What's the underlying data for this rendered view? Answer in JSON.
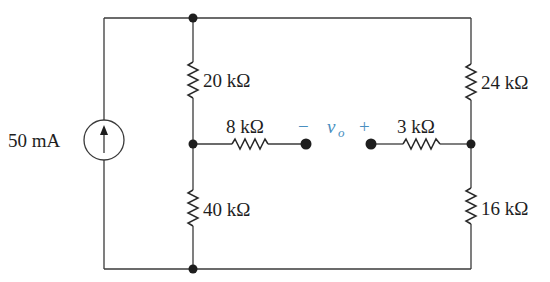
{
  "diagram": {
    "type": "circuit",
    "source": {
      "label": "50 mA",
      "kind": "current-source",
      "direction": "up"
    },
    "resistors": {
      "r20": "20 kΩ",
      "r40": "40 kΩ",
      "r8": "8 kΩ",
      "r3": "3 kΩ",
      "r24": "24 kΩ",
      "r16": "16 kΩ"
    },
    "output": {
      "minus": "−",
      "plus": "+",
      "var": "v",
      "sub": "o"
    },
    "colors": {
      "wire": "#3a3a3a",
      "label": "#1e1e1e",
      "output_label": "#4a8fc0"
    }
  }
}
